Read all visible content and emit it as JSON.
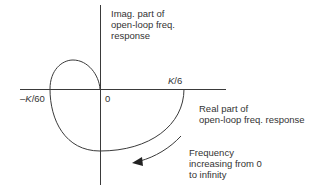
{
  "diagram": {
    "type": "nyquist-plot",
    "axes": {
      "imaginary_label": [
        "Imag. part of",
        "open-loop freq.",
        "response"
      ],
      "real_label": [
        "Real part of",
        "open-loop freq. response"
      ],
      "origin_label": "0"
    },
    "points": {
      "negative_crossing": {
        "k": "K",
        "rest": "/60",
        "sign": "–"
      },
      "positive_crossing": {
        "k": "K",
        "rest": "/6"
      }
    },
    "annotation": [
      "Frequency",
      "increasing from 0",
      "to infinity"
    ],
    "colors": {
      "line": "#3a3a3a",
      "text": "#333333",
      "background": "#ffffff"
    }
  }
}
